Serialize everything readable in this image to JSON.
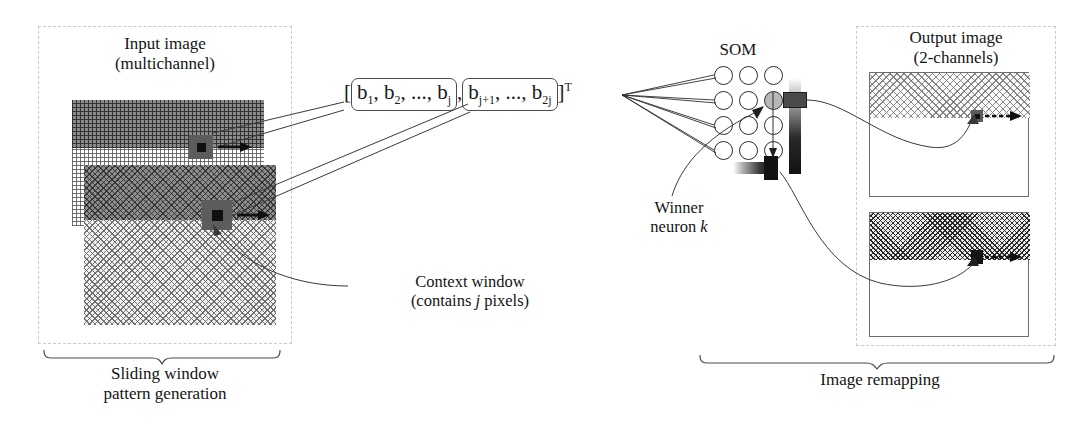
{
  "figure": {
    "accent_line": "#3a3a3a",
    "dash_color": "#c9c9c9"
  },
  "input_section": {
    "title_line1": "Input image",
    "title_line2": "(multichannel)",
    "caption_line1": "Sliding window",
    "caption_line2": "pattern generation",
    "context_label_line1": "Context window",
    "context_label_line2_pre": "(contains ",
    "context_label_line2_it": "j",
    "context_label_line2_post": " pixels)"
  },
  "vector": {
    "open_bracket": "[",
    "group1": "b₁, b₂, ..., bⱼ",
    "comma": ",",
    "group2": "bⱼ₊₁, ..., b₂ⱼ",
    "close_bracket": "]",
    "transpose": "T",
    "g1_parts": {
      "b": "b",
      "s1": "1",
      "s2": "2",
      "dots": "...",
      "sj": "j"
    },
    "g2_parts": {
      "b": "b",
      "sj1": "j+1",
      "dots": "...",
      "s2j": "2j"
    }
  },
  "som": {
    "label": "SOM",
    "rows": 4,
    "cols": 3,
    "winner_row": 2,
    "winner_col": 3,
    "winner_label_line1": "Winner",
    "winner_label_line2_pre": "neuron ",
    "winner_label_line2_it": "k",
    "node_fill": "#ffffff",
    "winner_fill": "#b7b7b7",
    "node_stroke": "#2b2b2b"
  },
  "output_section": {
    "title_line1": "Output image",
    "title_line2": "(2-channels)",
    "caption": "Image remapping",
    "channels": [
      {
        "name": "channel-1",
        "hatch": "sparse-light"
      },
      {
        "name": "channel-2",
        "hatch": "dense-dark"
      }
    ]
  }
}
